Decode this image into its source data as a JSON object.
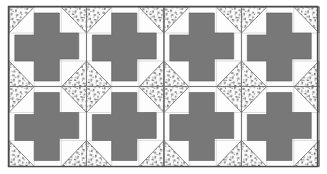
{
  "figure": {
    "block_name": "pinwheel-cross-block",
    "grid": {
      "columns": 4,
      "rows": 2,
      "total_blocks": 8
    },
    "colors": {
      "background": "#ffffff",
      "fabric_solid_gray": "#787878",
      "fabric_white": "#fdfdfd",
      "fabric_stipple_base": "#fbfbfb",
      "stipple_mark": "#444444",
      "outline": "#555555",
      "grid_line": "#7a7a7a",
      "border": "#4a4a4a"
    },
    "geometry": {
      "canvas_width": 327,
      "canvas_height": 174,
      "border_x": 8,
      "border_y": 6,
      "border_width": 310,
      "border_height": 161,
      "block_width": 77.5,
      "block_height": 80.5
    },
    "fabrics": [
      {
        "id": "gray",
        "label": "Solid gray fabric",
        "swatch": "#787878",
        "pieces_per_block": 1,
        "role": "center pinwheel cross"
      },
      {
        "id": "white",
        "label": "Solid white fabric",
        "swatch": "#fdfdfd",
        "pieces_per_block": 6,
        "role": "background triangles and squares"
      },
      {
        "id": "stipple",
        "label": "Stippled print fabric",
        "swatch": "#fbfbfb",
        "pieces_per_block": 2,
        "role": "opposite corner triangles"
      }
    ],
    "block_pieces": [
      {
        "name": "corner-triangle-top-left",
        "fabric": "stipple"
      },
      {
        "name": "corner-triangle-bottom-right",
        "fabric": "stipple"
      },
      {
        "name": "corner-triangle-top-right",
        "fabric": "stipple"
      },
      {
        "name": "corner-triangle-bottom-left",
        "fabric": "stipple"
      },
      {
        "name": "center-pinwheel-cross",
        "fabric": "gray"
      },
      {
        "name": "background-field",
        "fabric": "white"
      }
    ],
    "blocks": [
      {
        "index": 1,
        "row": 1,
        "column": 1,
        "label": "Block 1"
      },
      {
        "index": 2,
        "row": 1,
        "column": 2,
        "label": "Block 2"
      },
      {
        "index": 3,
        "row": 1,
        "column": 3,
        "label": "Block 3"
      },
      {
        "index": 4,
        "row": 1,
        "column": 4,
        "label": "Block 4"
      },
      {
        "index": 5,
        "row": 2,
        "column": 1,
        "label": "Block 5"
      },
      {
        "index": 6,
        "row": 2,
        "column": 2,
        "label": "Block 6"
      },
      {
        "index": 7,
        "row": 2,
        "column": 3,
        "label": "Block 7"
      },
      {
        "index": 8,
        "row": 2,
        "column": 4,
        "label": "Block 8"
      }
    ]
  }
}
